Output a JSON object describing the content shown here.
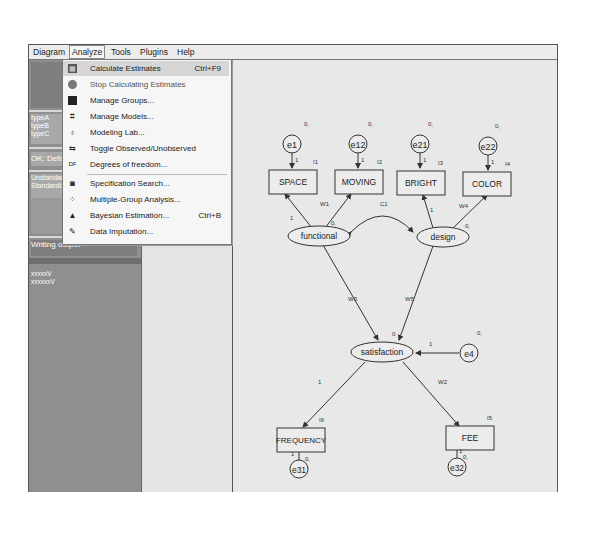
{
  "menubar": {
    "items": [
      {
        "label": "Diagram",
        "active": false
      },
      {
        "label": "Analyze",
        "active": true
      },
      {
        "label": "Tools",
        "active": false
      },
      {
        "label": "Plugins",
        "active": false
      },
      {
        "label": "Help",
        "active": false
      }
    ]
  },
  "analyze_menu": {
    "items": [
      {
        "label": "Calculate Estimates",
        "shortcut": "Ctrl+F9",
        "icon": "calculator-icon",
        "highlighted": true
      },
      {
        "label": "Stop Calculating Estimates",
        "shortcut": "",
        "icon": "stop-icon"
      },
      {
        "label": "Manage Groups...",
        "shortcut": "",
        "icon": "groups-icon"
      },
      {
        "label": "Manage Models...",
        "shortcut": "",
        "icon": "models-icon"
      },
      {
        "label": "Modeling Lab...",
        "shortcut": "",
        "icon": "flask-icon"
      },
      {
        "label": "Toggle Observed/Unobserved",
        "shortcut": "",
        "icon": "toggle-icon"
      },
      {
        "label": "Degrees of freedom...",
        "shortcut": "",
        "icon": "df-icon"
      },
      {
        "label": "Specification Search...",
        "shortcut": "",
        "icon": "binoculars-icon"
      },
      {
        "label": "Multiple-Group Analysis...",
        "shortcut": "",
        "icon": "multigroup-icon"
      },
      {
        "label": "Bayesian Estimation...",
        "shortcut": "Ctrl+B",
        "icon": "bayes-icon"
      },
      {
        "label": "Data Imputation...",
        "shortcut": "",
        "icon": "imputation-icon"
      }
    ]
  },
  "left_pane": {
    "groups_text": [
      "typeA",
      "typeB",
      "typeC"
    ],
    "model_text": "OK: Default",
    "status_text": [
      "Unstandardized",
      "Standardized"
    ],
    "writing_text": "Writing output",
    "list_items": [
      "xxxxxV",
      "xxxxxxV"
    ]
  },
  "diagram": {
    "observed": [
      {
        "name": "SPACE",
        "intercept": "I1"
      },
      {
        "name": "MOVING",
        "intercept": "I2"
      },
      {
        "name": "BRIGHT",
        "intercept": "I3"
      },
      {
        "name": "COLOR",
        "intercept": "I4"
      },
      {
        "name": "FREQUENCY",
        "intercept": "I6"
      },
      {
        "name": "FEE",
        "intercept": "I5"
      }
    ],
    "latent": [
      {
        "name": "functional",
        "mean": ""
      },
      {
        "name": "design",
        "mean": "0,"
      },
      {
        "name": "satisfaction",
        "mean": "0"
      }
    ],
    "errors": [
      {
        "name": "e1",
        "mean": "0,",
        "weight": "1"
      },
      {
        "name": "e12",
        "mean": "0,",
        "weight": "1"
      },
      {
        "name": "e21",
        "mean": "0,",
        "weight": "1"
      },
      {
        "name": "e22",
        "mean": "0,",
        "weight": "1"
      },
      {
        "name": "e4",
        "mean": "0,",
        "weight": "1"
      },
      {
        "name": "e31",
        "mean": "0,",
        "weight": "1"
      },
      {
        "name": "e32",
        "mean": "0,",
        "weight": "1"
      }
    ],
    "paths": {
      "functional_space": "1",
      "functional_moving": "W1",
      "functional_mean": "0,",
      "covariance": "C1",
      "design_bright": "1",
      "design_color": "W4",
      "functional_satisfaction": "W3",
      "design_satisfaction": "W5",
      "satisfaction_frequency": "1",
      "satisfaction_fee": "W2"
    }
  }
}
